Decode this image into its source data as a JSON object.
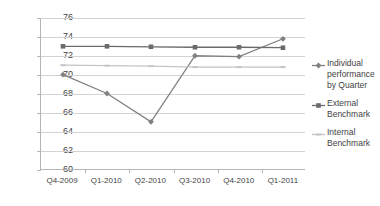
{
  "chart_data": {
    "type": "line",
    "title": "",
    "xlabel": "",
    "ylabel": "",
    "categories": [
      "Q4-2009",
      "Q1-2010",
      "Q2-2010",
      "Q3-2010",
      "Q4-2010",
      "Q1-2011"
    ],
    "ylim": [
      60,
      76
    ],
    "yticks": [
      60,
      62,
      64,
      66,
      68,
      70,
      72,
      74,
      76
    ],
    "ytick_labels": [
      "60",
      "62",
      "64",
      "66",
      "68",
      "70",
      "72",
      "74",
      "76"
    ],
    "grid": true,
    "legend_position": "right",
    "series": [
      {
        "name": "Individual performance by Quarter",
        "legend_label": "Individual performance by Quarter",
        "values": [
          70,
          68,
          65,
          72,
          71.9,
          73.8
        ],
        "color": "#808080",
        "marker": "diamond"
      },
      {
        "name": "External Benchmark",
        "legend_label": "External Benchmark",
        "values": [
          73,
          73,
          72.95,
          72.9,
          72.9,
          72.85
        ],
        "color": "#6b6b6b",
        "marker": "square"
      },
      {
        "name": "Internal Benchmark",
        "legend_label": "Internal Benchmark",
        "values": [
          71,
          70.95,
          70.9,
          70.8,
          70.8,
          70.8
        ],
        "color": "#c4c4c4",
        "marker": "dash"
      }
    ]
  },
  "colors": {
    "background": "#ffffff",
    "gridline": "#d3d3d3",
    "axis": "#b5b5b5",
    "text": "#3f3f3f"
  }
}
